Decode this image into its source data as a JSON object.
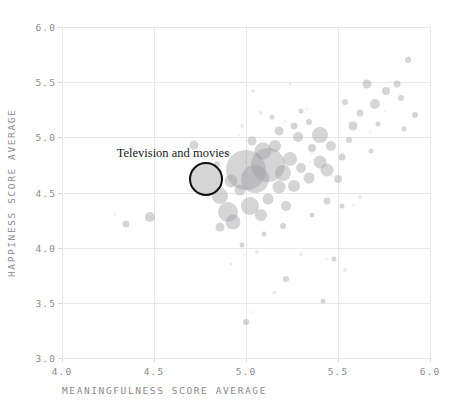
{
  "chart_data": {
    "type": "scatter",
    "title": "",
    "xlabel": "MEANINGFULNESS SCORE AVERAGE",
    "ylabel": "HAPPINESS SCORE AVERAGE",
    "xlim": [
      4.0,
      6.0
    ],
    "ylim": [
      3.0,
      6.0
    ],
    "xticks": [
      "4.0",
      "4.5",
      "5.0",
      "5.5",
      "6.0"
    ],
    "yticks": [
      "3.0",
      "3.5",
      "4.0",
      "4.5",
      "5.0",
      "5.5",
      "6.0"
    ],
    "grid": true,
    "legend": "none",
    "marker_color": "#9a9a9e",
    "marker_opacity": 0.42,
    "highlight_color": "#111111",
    "annotations": [
      {
        "label": "Television and movies",
        "x": 4.78,
        "y": 4.62,
        "size": 34,
        "circled": true,
        "label_x": 4.58,
        "label_y": 4.85
      }
    ],
    "note": "Bubble area encodes activity frequency; each bubble is one activity.",
    "points": [
      {
        "x": 4.35,
        "y": 4.21,
        "s": 7
      },
      {
        "x": 4.48,
        "y": 4.28,
        "s": 10
      },
      {
        "x": 4.78,
        "y": 4.62,
        "s": 34
      },
      {
        "x": 4.72,
        "y": 4.93,
        "s": 9
      },
      {
        "x": 4.92,
        "y": 4.6,
        "s": 13
      },
      {
        "x": 4.86,
        "y": 4.47,
        "s": 16
      },
      {
        "x": 4.97,
        "y": 4.52,
        "s": 11
      },
      {
        "x": 4.9,
        "y": 4.32,
        "s": 20
      },
      {
        "x": 4.93,
        "y": 4.23,
        "s": 15
      },
      {
        "x": 4.86,
        "y": 4.19,
        "s": 9
      },
      {
        "x": 5.02,
        "y": 4.38,
        "s": 18
      },
      {
        "x": 5.08,
        "y": 4.3,
        "s": 12
      },
      {
        "x": 5.0,
        "y": 4.7,
        "s": 40
      },
      {
        "x": 5.05,
        "y": 4.62,
        "s": 28
      },
      {
        "x": 5.12,
        "y": 4.75,
        "s": 34
      },
      {
        "x": 5.09,
        "y": 4.88,
        "s": 17
      },
      {
        "x": 5.16,
        "y": 4.92,
        "s": 12
      },
      {
        "x": 5.03,
        "y": 4.97,
        "s": 9
      },
      {
        "x": 5.2,
        "y": 4.68,
        "s": 16
      },
      {
        "x": 5.24,
        "y": 4.8,
        "s": 14
      },
      {
        "x": 5.18,
        "y": 4.55,
        "s": 13
      },
      {
        "x": 5.26,
        "y": 4.56,
        "s": 12
      },
      {
        "x": 5.12,
        "y": 4.44,
        "s": 11
      },
      {
        "x": 5.22,
        "y": 4.38,
        "s": 10
      },
      {
        "x": 5.3,
        "y": 4.72,
        "s": 10
      },
      {
        "x": 5.34,
        "y": 4.63,
        "s": 11
      },
      {
        "x": 5.4,
        "y": 4.78,
        "s": 13
      },
      {
        "x": 5.36,
        "y": 4.9,
        "s": 8
      },
      {
        "x": 5.28,
        "y": 5.0,
        "s": 10
      },
      {
        "x": 5.18,
        "y": 5.06,
        "s": 9
      },
      {
        "x": 5.26,
        "y": 5.1,
        "s": 7
      },
      {
        "x": 5.4,
        "y": 5.02,
        "s": 16
      },
      {
        "x": 5.46,
        "y": 4.92,
        "s": 10
      },
      {
        "x": 5.44,
        "y": 4.7,
        "s": 13
      },
      {
        "x": 5.5,
        "y": 4.62,
        "s": 8
      },
      {
        "x": 5.52,
        "y": 4.82,
        "s": 7
      },
      {
        "x": 5.58,
        "y": 5.1,
        "s": 9
      },
      {
        "x": 5.62,
        "y": 5.22,
        "s": 7
      },
      {
        "x": 5.54,
        "y": 5.32,
        "s": 6
      },
      {
        "x": 5.7,
        "y": 5.3,
        "s": 10
      },
      {
        "x": 5.76,
        "y": 5.42,
        "s": 8
      },
      {
        "x": 5.82,
        "y": 5.48,
        "s": 7
      },
      {
        "x": 5.88,
        "y": 5.7,
        "s": 6
      },
      {
        "x": 5.84,
        "y": 5.36,
        "s": 6
      },
      {
        "x": 5.66,
        "y": 5.48,
        "s": 9
      },
      {
        "x": 5.72,
        "y": 5.12,
        "s": 5
      },
      {
        "x": 5.92,
        "y": 5.2,
        "s": 6
      },
      {
        "x": 5.86,
        "y": 5.08,
        "s": 5
      },
      {
        "x": 5.3,
        "y": 5.24,
        "s": 5
      },
      {
        "x": 5.14,
        "y": 5.18,
        "s": 5
      },
      {
        "x": 5.08,
        "y": 5.22,
        "s": 4
      },
      {
        "x": 4.98,
        "y": 5.1,
        "s": 4
      },
      {
        "x": 5.44,
        "y": 4.42,
        "s": 7
      },
      {
        "x": 5.36,
        "y": 4.3,
        "s": 5
      },
      {
        "x": 5.52,
        "y": 4.38,
        "s": 5
      },
      {
        "x": 5.2,
        "y": 4.2,
        "s": 6
      },
      {
        "x": 5.1,
        "y": 4.12,
        "s": 5
      },
      {
        "x": 4.98,
        "y": 4.02,
        "s": 5
      },
      {
        "x": 5.06,
        "y": 3.96,
        "s": 4
      },
      {
        "x": 5.3,
        "y": 3.94,
        "s": 4
      },
      {
        "x": 5.48,
        "y": 3.9,
        "s": 5
      },
      {
        "x": 5.54,
        "y": 3.8,
        "s": 4
      },
      {
        "x": 5.22,
        "y": 3.72,
        "s": 6
      },
      {
        "x": 5.0,
        "y": 3.33,
        "s": 6
      },
      {
        "x": 4.92,
        "y": 3.85,
        "s": 3
      },
      {
        "x": 5.42,
        "y": 3.52,
        "s": 5
      },
      {
        "x": 5.16,
        "y": 3.6,
        "s": 3
      },
      {
        "x": 5.62,
        "y": 4.46,
        "s": 4
      },
      {
        "x": 5.68,
        "y": 4.88,
        "s": 5
      },
      {
        "x": 5.04,
        "y": 5.42,
        "s": 4
      },
      {
        "x": 5.24,
        "y": 5.48,
        "s": 3
      },
      {
        "x": 4.9,
        "y": 4.86,
        "s": 5
      },
      {
        "x": 4.84,
        "y": 4.76,
        "s": 6
      },
      {
        "x": 5.56,
        "y": 4.98,
        "s": 6
      },
      {
        "x": 5.34,
        "y": 5.14,
        "s": 6
      }
    ]
  },
  "axis": {
    "y_title": "HAPPINESS SCORE AVERAGE",
    "x_title": "MEANINGFULNESS SCORE AVERAGE"
  }
}
